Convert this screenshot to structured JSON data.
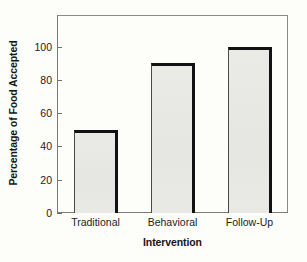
{
  "chart_data": {
    "type": "bar",
    "title": "",
    "subtitle": "",
    "categories": [
      "Traditional",
      "Behavioral",
      "Follow-Up"
    ],
    "values": [
      50,
      90,
      100
    ],
    "xlabel": "Intervention",
    "ylabel": "Percentage of Food Accepted",
    "ylim": [
      0,
      119
    ],
    "yticks": [
      0,
      20,
      40,
      60,
      80,
      100
    ],
    "ytick_labels": [
      "0",
      "20",
      "40",
      "60",
      "80",
      "100"
    ],
    "grid": false,
    "legend": null,
    "legend_position": "none",
    "annotations": [],
    "series": [
      {
        "name": "Percentage of Food Accepted",
        "values": [
          50,
          90,
          100
        ]
      }
    ],
    "colors": {
      "bar_fill": "#e9e9e5",
      "bar_edge": "#121212",
      "axis": "#7b7b7b",
      "text": "#1c1c1c",
      "background": "#fdfdfa"
    }
  }
}
